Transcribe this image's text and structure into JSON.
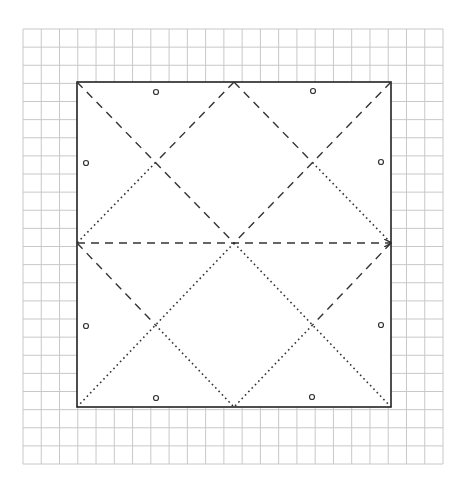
{
  "diagram": {
    "type": "origami-crease-pattern",
    "canvas": {
      "width": 466,
      "height": 486,
      "background": "#ffffff"
    },
    "grid": {
      "x0": 23,
      "y0": 29,
      "x1": 443,
      "y1": 464,
      "cols": 23,
      "rows": 24,
      "color": "#c8c8c8"
    },
    "square": {
      "x0": 77,
      "y0": 82,
      "x1": 391,
      "y1": 407,
      "stroke": "#222222",
      "width": 1.6
    },
    "points": {
      "TL": [
        77,
        82
      ],
      "TM": [
        234,
        82
      ],
      "TR": [
        391,
        82
      ],
      "ML": [
        77,
        243
      ],
      "C": [
        234,
        243
      ],
      "MR": [
        391,
        243
      ],
      "BL": [
        77,
        407
      ],
      "BM": [
        234,
        407
      ],
      "BR": [
        391,
        407
      ],
      "Iul": [
        155.5,
        162.5
      ],
      "Iur": [
        312.5,
        162.5
      ],
      "Ill": [
        155.5,
        325
      ],
      "Ilr": [
        312.5,
        325
      ]
    },
    "lines": [
      {
        "from": "TL",
        "to": "C",
        "style": "valley"
      },
      {
        "from": "TR",
        "to": "C",
        "style": "valley"
      },
      {
        "from": "C",
        "to": "BL",
        "style": "mountain"
      },
      {
        "from": "C",
        "to": "BR",
        "style": "mountain"
      },
      {
        "from": "TM",
        "to": "Iul",
        "style": "valley"
      },
      {
        "from": "Iul",
        "to": "ML",
        "style": "mountain"
      },
      {
        "from": "TM",
        "to": "Iur",
        "style": "valley"
      },
      {
        "from": "Iur",
        "to": "MR",
        "style": "mountain"
      },
      {
        "from": "ML",
        "to": "Ill",
        "style": "valley"
      },
      {
        "from": "Ill",
        "to": "BM",
        "style": "mountain"
      },
      {
        "from": "MR",
        "to": "Ilr",
        "style": "valley"
      },
      {
        "from": "Ilr",
        "to": "BM",
        "style": "mountain"
      },
      {
        "from": "ML",
        "to": "MR",
        "style": "valley",
        "arrow": true
      }
    ],
    "styles": {
      "valley": {
        "dash": "8,6",
        "color": "#333333",
        "width": 1.4
      },
      "mountain": {
        "dash": "1.6,3.2",
        "color": "#333333",
        "width": 1.6
      }
    },
    "markers": [
      {
        "x": 156,
        "y": 92
      },
      {
        "x": 313,
        "y": 91
      },
      {
        "x": 86,
        "y": 163
      },
      {
        "x": 381,
        "y": 162
      },
      {
        "x": 86,
        "y": 326
      },
      {
        "x": 381,
        "y": 325
      },
      {
        "x": 156,
        "y": 398
      },
      {
        "x": 312,
        "y": 397
      }
    ],
    "marker_radius": 2.5
  }
}
